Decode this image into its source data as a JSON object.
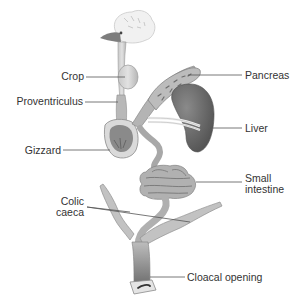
{
  "diagram": {
    "type": "anatomical-labeled-diagram",
    "colors": {
      "organ_light": "#d4d4d4",
      "organ_mid": "#a9a9a9",
      "organ_dark": "#6f6f6f",
      "liver": "#5f5f5f",
      "outline": "#8a8a8a",
      "leader_line": "#555555",
      "label_text": "#333333",
      "background": "#ffffff"
    },
    "labels": {
      "crop": "Crop",
      "proventriculus": "Proventriculus",
      "gizzard": "Gizzard",
      "colic_caeca_1": "Colic",
      "colic_caeca_2": "caeca",
      "pancreas": "Pancreas",
      "liver": "Liver",
      "small_intestine_1": "Small",
      "small_intestine_2": "intestine",
      "cloacal_opening": "Cloacal opening"
    }
  }
}
